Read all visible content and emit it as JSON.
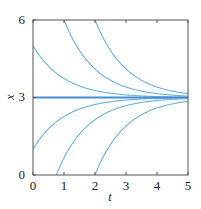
{
  "chart_data": {
    "type": "line",
    "title": "",
    "xlabel": "t",
    "ylabel": "x",
    "xlim": [
      0,
      5
    ],
    "ylim": [
      0,
      6
    ],
    "xticks": [
      "0",
      "1",
      "2",
      "3",
      "4",
      "5"
    ],
    "yticks": [
      "0",
      "3",
      "6"
    ],
    "grid": false,
    "legend": "none",
    "equilibrium": {
      "value": 3,
      "color": "#4a8cd0"
    },
    "series": [
      {
        "name": "x0=25.2",
        "x0": 25.17,
        "color": "#6ab2e0"
      },
      {
        "name": "x0=11.15",
        "x0": 11.15,
        "color": "#6ab2e0"
      },
      {
        "name": "x0=5",
        "x0": 5,
        "color": "#6ab2e0"
      },
      {
        "name": "x0=1",
        "x0": 1,
        "color": "#6ab2e0"
      },
      {
        "name": "x0=-3.35",
        "x0": -3.35,
        "color": "#6ab2e0"
      },
      {
        "name": "x0=-19.2",
        "x0": -19.17,
        "color": "#6ab2e0"
      }
    ]
  }
}
